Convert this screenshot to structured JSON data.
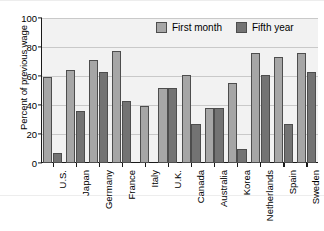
{
  "chart_data": {
    "type": "bar",
    "title": "",
    "subtitle": "",
    "xlabel": "",
    "ylabel": "Percent of previous wage",
    "ylim": [
      0,
      100
    ],
    "yticks": [
      0,
      20,
      40,
      60,
      80,
      100
    ],
    "grid": true,
    "legend_position": "top-right-inside",
    "categories": [
      "U.S.",
      "Japan",
      "Germany",
      "France",
      "Italy",
      "U.K.",
      "Canada",
      "Australia",
      "Korea",
      "Netherlands",
      "Spain",
      "Sweden"
    ],
    "series": [
      {
        "name": "First month",
        "color": "#a6a6a6",
        "values": [
          59,
          64,
          71,
          77,
          39,
          52,
          61,
          38,
          55,
          76,
          73,
          76
        ]
      },
      {
        "name": "Fifth year",
        "color": "#737373",
        "values": [
          7,
          36,
          63,
          43,
          null,
          52,
          27,
          38,
          10,
          61,
          27,
          63
        ]
      }
    ],
    "annotations": []
  },
  "legend": {
    "entries": [
      {
        "label": "First month"
      },
      {
        "label": "Fifth year"
      }
    ]
  },
  "colors": {
    "first_month": "#a6a6a6",
    "fifth_year": "#737373",
    "plot_background": "#f2f2f2",
    "axis": "#1a1a1a",
    "gridline": "#c9c9c9"
  }
}
